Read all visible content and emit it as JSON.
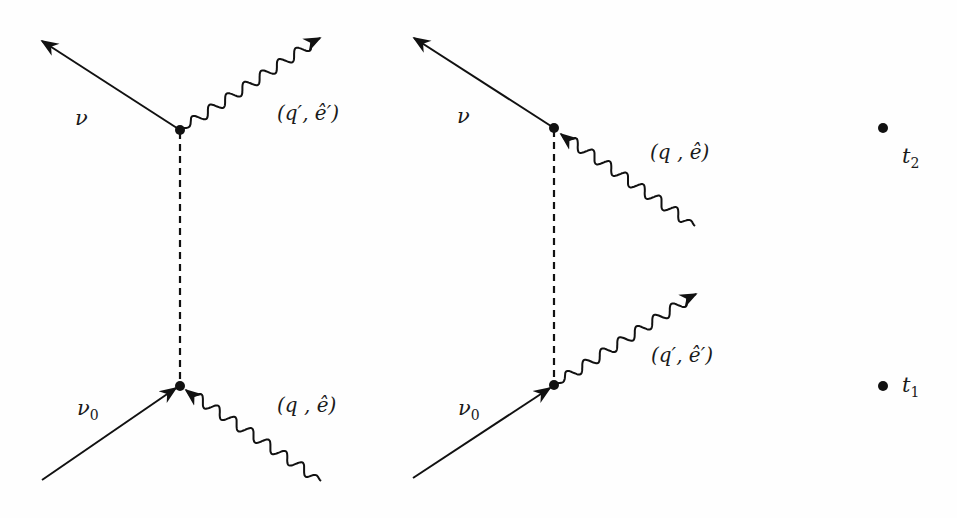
{
  "diagrams": [
    {
      "id": "left",
      "labels": {
        "outgoing_lepton": "ν",
        "incoming_lepton": "ν",
        "incoming_lepton_sub": "0",
        "outgoing_photon": "(q′, ê′)",
        "incoming_photon": "(q , ê)"
      }
    },
    {
      "id": "right",
      "labels": {
        "outgoing_lepton": "ν",
        "incoming_lepton": "ν",
        "incoming_lepton_sub": "0",
        "incoming_photon": "(q , ê)",
        "outgoing_photon": "(q′, ê′)"
      }
    }
  ],
  "time_axis": {
    "t2": {
      "symbol": "t",
      "sub": "2"
    },
    "t1": {
      "symbol": "t",
      "sub": "1"
    }
  },
  "colors": {
    "ink": "#111111",
    "background": "#fefefe"
  }
}
